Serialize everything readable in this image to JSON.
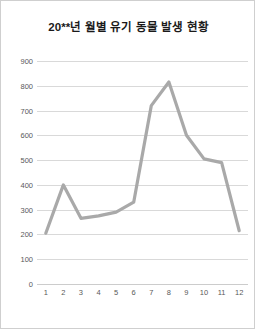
{
  "chart_data": {
    "type": "line",
    "title": "20**년 월별 유기 동물 발생 현황",
    "xlabel": "",
    "ylabel": "",
    "categories": [
      "1",
      "2",
      "3",
      "4",
      "5",
      "6",
      "7",
      "8",
      "9",
      "10",
      "11",
      "12"
    ],
    "values": [
      205,
      400,
      265,
      275,
      290,
      330,
      720,
      815,
      600,
      505,
      490,
      215
    ],
    "series": [
      {
        "name": "발생 현황",
        "values": [
          205,
          400,
          265,
          275,
          290,
          330,
          720,
          815,
          600,
          505,
          490,
          215
        ]
      }
    ],
    "ylim": [
      0,
      900
    ],
    "ytick_values": [
      0,
      100,
      200,
      300,
      400,
      500,
      600,
      700,
      800,
      900
    ],
    "ytick_labels": [
      "0",
      "100",
      "200",
      "300",
      "400",
      "500",
      "600",
      "700",
      "800",
      "900"
    ],
    "xtick_labels": [
      "1",
      "2",
      "3",
      "4",
      "5",
      "6",
      "7",
      "8",
      "9",
      "10",
      "11",
      "12"
    ],
    "grid": true,
    "legend": false,
    "legend_position": "none",
    "line_color": "#a9a9a9",
    "grid_color": "#d9d9d9",
    "axis_text_color": "#595959",
    "title_color": "#1a1a1a",
    "background_color": "#ffffff",
    "border_color": "#cfcfcf"
  }
}
